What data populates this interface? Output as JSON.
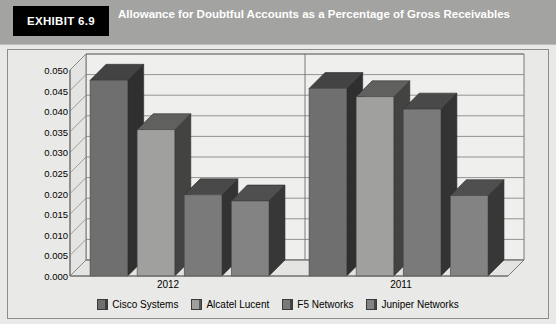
{
  "header": {
    "exhibit_tab": "EXHIBIT 6.9",
    "title": "Allowance for Doubtful Accounts as a Percentage of Gross Receivables",
    "tab_background": "#000000",
    "bar_background": "#a3a3a1"
  },
  "chart_data": {
    "type": "bar",
    "title": "Allowance for Doubtful Accounts as a Percentage of Gross Receivables",
    "xlabel": "",
    "ylabel": "",
    "categories": [
      "2012",
      "2011"
    ],
    "series": [
      {
        "name": "Cisco Systems",
        "values": [
          0.0475,
          0.0455
        ],
        "color": "#6f6f6f"
      },
      {
        "name": "Alcatel Lucent",
        "values": [
          0.0355,
          0.0435
        ],
        "color": "#a0a09e"
      },
      {
        "name": "F5 Networks",
        "values": [
          0.0197,
          0.0405
        ],
        "color": "#7a7a7a"
      },
      {
        "name": "Juniper Networks",
        "values": [
          0.0182,
          0.0195
        ],
        "color": "#838383"
      }
    ],
    "ylim": [
      0.0,
      0.05
    ],
    "ytick_step": 0.005,
    "yticks": [
      "0.050",
      "0.045",
      "0.040",
      "0.035",
      "0.030",
      "0.025",
      "0.020",
      "0.015",
      "0.010",
      "0.005",
      "0.000"
    ],
    "grid": true,
    "legend_position": "bottom",
    "three_d": true
  },
  "legend": {
    "items": [
      {
        "label": "Cisco Systems",
        "color": "#6f6f6f"
      },
      {
        "label": "Alcatel Lucent",
        "color": "#a0a09e"
      },
      {
        "label": "F5 Networks",
        "color": "#7a7a7a"
      },
      {
        "label": "Juniper Networks",
        "color": "#838383"
      }
    ]
  },
  "axis": {
    "y_tick_labels": [
      "0.050",
      "0.045",
      "0.040",
      "0.035",
      "0.030",
      "0.025",
      "0.020",
      "0.015",
      "0.010",
      "0.005",
      "0.000"
    ],
    "x_category_labels": [
      "2012",
      "2011"
    ]
  }
}
